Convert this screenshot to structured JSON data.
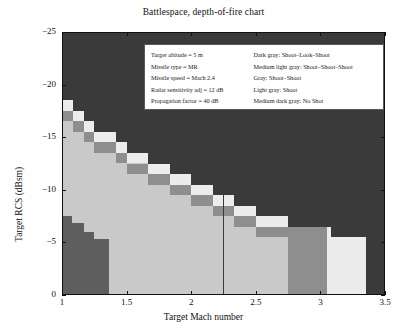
{
  "chart_data": {
    "type": "heatmap",
    "title": "Battlespace, depth-of-fire chart",
    "xlabel": "Target Mach number",
    "ylabel": "Target RCS (dBsm)",
    "xlim": [
      1,
      3.5
    ],
    "ylim": [
      -25,
      0
    ],
    "y_axis_inverted": true,
    "xticks": [
      1,
      1.5,
      2,
      2.5,
      3,
      3.5
    ],
    "xtick_labels": [
      "1",
      "1.5",
      "2",
      "2.5",
      "3",
      "3.5"
    ],
    "yticks": [
      -25,
      -20,
      -15,
      -10,
      -5,
      0
    ],
    "ytick_labels": [
      "−25",
      "−20",
      "−15",
      "−10",
      "−5",
      "0"
    ],
    "grid": false,
    "legend_position": "upper-center-inside",
    "categories_colors": {
      "shoot_look_shoot": "#3a3a3a",
      "shoot_shoot_shoot": "#c9c9c9",
      "shoot_shoot": "#8e8e8e",
      "shoot": "#ececec",
      "no_shot": "#5e5e5e"
    },
    "cell_size": {
      "x": 0.0833,
      "y": 1.0
    },
    "regions": [
      {
        "label": "Shoot-Look-Shoot",
        "color": "#3a3a3a",
        "description": "upper-right dark background above the staircase boundary"
      },
      {
        "label": "Shoot-Shoot-Shoot",
        "color": "#c9c9c9",
        "description": "large medium-light interior region below the staircase"
      },
      {
        "label": "Shoot-Shoot",
        "color": "#8e8e8e",
        "description": "mid-gray staircase step cells along the diagonal and the wide column near Mach 2.75-3.05"
      },
      {
        "label": "Shoot",
        "color": "#ececec",
        "description": "near-white staircase cells just below the dark boundary and the block at Mach 3.05-3.35"
      },
      {
        "label": "No Shot",
        "color": "#5e5e5e",
        "description": "dark wedge in the lower-left corner below RCS -7"
      }
    ],
    "staircase_boundary_points": [
      {
        "mach": 1.0,
        "rcs": -18.5
      },
      {
        "mach": 1.08,
        "rcs": -17.5
      },
      {
        "mach": 1.17,
        "rcs": -16.5
      },
      {
        "mach": 1.25,
        "rcs": -15.5
      },
      {
        "mach": 1.42,
        "rcs": -14.5
      },
      {
        "mach": 1.5,
        "rcs": -13.5
      },
      {
        "mach": 1.67,
        "rcs": -12.5
      },
      {
        "mach": 1.83,
        "rcs": -11.5
      },
      {
        "mach": 2.0,
        "rcs": -10.5
      },
      {
        "mach": 2.17,
        "rcs": -9.5
      },
      {
        "mach": 2.33,
        "rcs": -8.5
      },
      {
        "mach": 2.5,
        "rcs": -7.5
      },
      {
        "mach": 2.75,
        "rcs": -6.5
      },
      {
        "mach": 3.05,
        "rcs": -5.5
      },
      {
        "mach": 3.35,
        "rcs": -4.5
      }
    ]
  },
  "annotation": {
    "parameters": [
      "Target altitude = 5 m",
      "Missile type = MR",
      "Missile speed = Mach 2.4",
      "Radar sensitivity adj = 12 dB",
      "Propagation factor = 40 dB"
    ],
    "color_key": [
      "Dark gray: Shoot–Look–Shoot",
      "Medium light gray: Shoot–Shoot–Shoot",
      "Gray: Shoot–Shoot",
      "Light gray: Shoot",
      "Medium dark gray: No Shot"
    ]
  },
  "axes": {
    "xtick_labels": [
      "1",
      "1.5",
      "2",
      "2.5",
      "3",
      "3.5"
    ],
    "ytick_labels": [
      "−25",
      "−20",
      "−15",
      "−10",
      "−5",
      "0"
    ]
  }
}
